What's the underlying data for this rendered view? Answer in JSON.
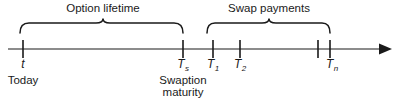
{
  "figure": {
    "axis": {
      "name": "time-axis",
      "arrow": "right-arrow",
      "line_color": "#4d4d4d",
      "y": 49,
      "x_start": 8,
      "x_end": 392
    },
    "brackets": [
      {
        "id": "option-lifetime",
        "label": "Option lifetime",
        "x_start": 20,
        "x_end": 183,
        "label_x": 103,
        "label_y": 3
      },
      {
        "id": "swap-payments",
        "label": "Swap payments",
        "x_start": 207,
        "x_end": 330,
        "label_x": 269,
        "label_y": 3
      }
    ],
    "ticks": [
      {
        "id": "t",
        "symbol": "t",
        "subscript": "",
        "x": 23,
        "labeled": true
      },
      {
        "id": "Ts",
        "symbol": "T",
        "subscript": "s",
        "x": 183,
        "labeled": true
      },
      {
        "id": "T1",
        "symbol": "T",
        "subscript": "1",
        "x": 213,
        "labeled": true
      },
      {
        "id": "T2",
        "symbol": "T",
        "subscript": "2",
        "x": 240,
        "labeled": true
      },
      {
        "id": "Tk",
        "symbol": "",
        "subscript": "",
        "x": 318,
        "labeled": false
      },
      {
        "id": "Tn",
        "symbol": "T",
        "subscript": "n",
        "x": 330,
        "labeled": true
      }
    ],
    "notes": [
      {
        "id": "today",
        "text": "Today",
        "text2": "",
        "x": 23,
        "y": 72
      },
      {
        "id": "swaption-maturity",
        "text": "Swaption",
        "text2": "maturity",
        "x": 183,
        "y": 72
      }
    ],
    "colors": {
      "ink": "#1a1a1a",
      "axis": "#4d4d4d",
      "background": "#ffffff"
    }
  }
}
